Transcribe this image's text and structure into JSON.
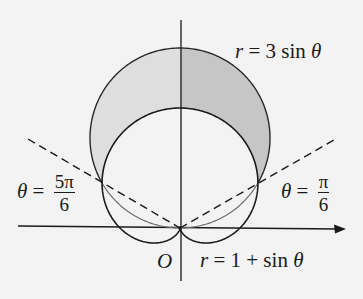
{
  "figure": {
    "background": "#f3f3f3",
    "stroke_color": "#1a1a1a",
    "fill_left": "#dedede",
    "fill_right": "#c6c6c6",
    "labels": {
      "circle": {
        "lhs": "r",
        "eq": " = 3 sin ",
        "theta": "θ"
      },
      "cardioid": {
        "lhs": "r",
        "eq": " = 1 + sin ",
        "theta": "θ"
      },
      "origin": "O",
      "ray_left": {
        "theta": "θ",
        "eq": " = ",
        "num": "5π",
        "den": "6"
      },
      "ray_right": {
        "theta": "θ",
        "eq": " = ",
        "num": "π",
        "den": "6"
      }
    }
  },
  "chart_data": {
    "type": "polar-curves",
    "title": "",
    "curves": [
      {
        "name": "r = 3 sin θ",
        "kind": "circle",
        "equation": "r = 3 sin(theta)"
      },
      {
        "name": "r = 1 + sin θ",
        "kind": "cardioid",
        "equation": "r = 1 + sin(theta)"
      }
    ],
    "rays": [
      {
        "label": "θ = π/6",
        "theta": 0.5236,
        "style": "dashed"
      },
      {
        "label": "θ = 5π/6",
        "theta": 2.618,
        "style": "dashed"
      }
    ],
    "shaded_region": {
      "description": "Region inside r = 3 sin θ and outside r = 1 + sin θ",
      "theta_range": [
        "π/6",
        "5π/6"
      ],
      "intersection_points": [
        {
          "theta": "π/6",
          "r": 1.5
        },
        {
          "theta": "5π/6",
          "r": 1.5
        }
      ]
    },
    "origin_label": "O",
    "axes": {
      "x_arrow": true,
      "y_arrow": false
    },
    "grid": false,
    "render": {
      "origin_px": [
        180,
        228
      ],
      "unit_px": 60
    }
  }
}
